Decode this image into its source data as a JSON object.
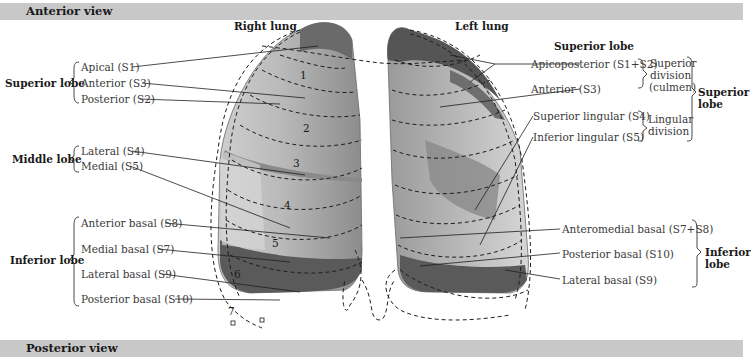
{
  "headers": {
    "top": "Anterior view",
    "bottom": "Posterior view"
  },
  "right_lung": {
    "title": "Right lung",
    "groups": [
      {
        "name": "Superior lobe",
        "segments": [
          "Apical (S1)",
          "Anterior (S3)",
          "Posterior (S2)"
        ]
      },
      {
        "name": "Middle lobe",
        "segments": [
          "Lateral (S4)",
          "Medial (S5)"
        ]
      },
      {
        "name": "Inferior lobe",
        "segments": [
          "Anterior basal (S8)",
          "Medial basal (S7)",
          "Lateral basal (S9)",
          "Posterior basal (S10)"
        ]
      }
    ],
    "numbers": [
      "1",
      "2",
      "3",
      "4",
      "5",
      "6",
      "7"
    ]
  },
  "left_lung": {
    "title": "Left lung",
    "superior_lobe_heading": "Superior lobe",
    "segments": {
      "apicoposterior": "Apicoposterior (S1+S2)",
      "anterior": "Anterior (S3)",
      "superior_lingular": "Superior lingular (S4)",
      "inferior_lingular": "Inferior lingular (S5)",
      "anteromedial_basal": "Anteromedial basal (S7+S8)",
      "posterior_basal": "Posterior basal (S10)",
      "lateral_basal": "Lateral basal (S9)"
    },
    "divisions": {
      "superior_line1": "Superior",
      "superior_line2": "division",
      "superior_line3": "(culmen)",
      "lingular_line1": "Lingular",
      "lingular_line2": "division"
    },
    "lobes": {
      "superior_line1": "Superior",
      "superior_line2": "lobe",
      "inferior_line1": "Inferior",
      "inferior_line2": "lobe"
    }
  },
  "colors": {
    "header_bar": "#c8c8c8",
    "lung_light": "#d4d4d4",
    "lung_mid": "#a8a8a8",
    "lung_dark": "#5c5c5c",
    "lines": "#222222"
  }
}
